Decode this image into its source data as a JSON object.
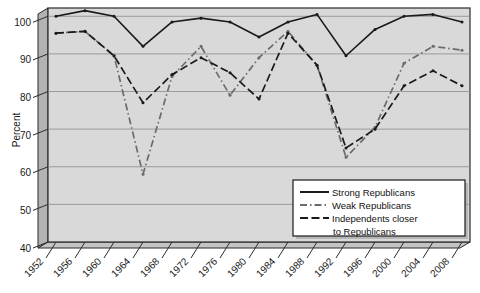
{
  "chart_data": {
    "type": "line",
    "title": "",
    "subtitle": "",
    "xlabel": "",
    "ylabel": "Percent",
    "ylim": [
      40,
      100
    ],
    "yticks": [
      40,
      50,
      60,
      70,
      80,
      90,
      100
    ],
    "grid": true,
    "legend_position": "bottom-right",
    "categories": [
      "1952",
      "1956",
      "1960",
      "1964",
      "1968",
      "1972",
      "1976",
      "1980",
      "1984",
      "1988",
      "1992",
      "1996",
      "2000",
      "2004",
      "2008"
    ],
    "x": [
      1952,
      1956,
      1960,
      1964,
      1968,
      1972,
      1976,
      1980,
      1984,
      1988,
      1992,
      1996,
      2000,
      2004,
      2008
    ],
    "series": [
      {
        "name": "Strong Republicans",
        "style": "solid",
        "color": "#1a1a1a",
        "values": [
          100.0,
          101.5,
          100.0,
          92.0,
          98.5,
          99.5,
          98.5,
          94.5,
          98.5,
          100.5,
          89.5,
          96.5,
          100.0,
          100.5,
          98.5
        ]
      },
      {
        "name": "Weak Republicans",
        "style": "dash-dot",
        "color": "#6b6b6b",
        "values": [
          95.5,
          96.0,
          89.5,
          58.0,
          84.0,
          92.0,
          79.0,
          89.0,
          96.0,
          87.0,
          62.5,
          70.5,
          87.5,
          92.0,
          91.0
        ]
      },
      {
        "name": "Independents closer to Republicans",
        "style": "long-dash",
        "color": "#1a1a1a",
        "values": [
          95.5,
          96.0,
          89.5,
          77.0,
          84.5,
          89.0,
          85.0,
          78.0,
          95.5,
          87.0,
          65.0,
          70.0,
          81.5,
          85.5,
          81.5
        ]
      }
    ]
  },
  "legend": {
    "entries": [
      {
        "label": "Strong Republicans",
        "style": "solid"
      },
      {
        "label": "Weak Republicans",
        "style": "dash-dot"
      },
      {
        "label": "Independents closer",
        "style": "long-dash"
      },
      {
        "label": "to Republicans",
        "style": "none"
      }
    ]
  },
  "axes": {
    "y_title": "Percent",
    "y_ticks": [
      "100",
      "90",
      "80",
      "70",
      "60",
      "50",
      "40"
    ],
    "x_ticks": [
      "1952",
      "1956",
      "1960",
      "1964",
      "1968",
      "1972",
      "1976",
      "1980",
      "1984",
      "1988",
      "1992",
      "1996",
      "2000",
      "2004",
      "2008"
    ]
  },
  "colors": {
    "plot_background": "#d9d9d9",
    "wall_shade": "#b3b3b3",
    "gridline": "#8a8a8a",
    "frame": "#2b2b2b",
    "legend_background": "#ffffff",
    "strong": "#1a1a1a",
    "weak": "#6b6b6b",
    "independents": "#1a1a1a"
  }
}
